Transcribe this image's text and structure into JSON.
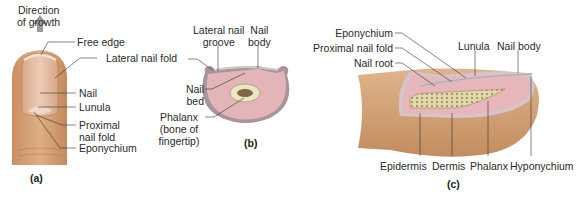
{
  "panels": {
    "a": {
      "caption": "(a)",
      "labels": {
        "direction_line1": "Direction",
        "direction_line2": "of growth",
        "free_edge": "Free edge",
        "lateral_nail_fold": "Lateral nail fold",
        "nail": "Nail",
        "lunula": "Lunula",
        "proximal_line1": "Proximal",
        "proximal_line2": "nail fold",
        "eponychium": "Eponychium"
      }
    },
    "b": {
      "caption": "(b)",
      "labels": {
        "lateral_groove_line1": "Lateral nail",
        "lateral_groove_line2": "groove",
        "nail_body_line1": "Nail",
        "nail_body_line2": "body",
        "nail_bed_line1": "Nail",
        "nail_bed_line2": "bed",
        "phalanx_line1": "Phalanx",
        "phalanx_line2": "(bone of",
        "phalanx_line3": "fingertip)"
      }
    },
    "c": {
      "caption": "(c)",
      "labels": {
        "eponychium": "Eponychium",
        "proximal_nail_fold": "Proximal nail fold",
        "nail_root": "Nail root",
        "lunula": "Lunula",
        "nail_body": "Nail body",
        "epidermis": "Epidermis",
        "dermis": "Dermis",
        "phalanx": "Phalanx",
        "hyponychium": "Hyponychium"
      }
    }
  },
  "colors": {
    "skin": "#d9a57a",
    "skin_dark": "#c08a5e",
    "nail": "#e8c2a8",
    "dermis": "#e8b9bd",
    "epidermis_line": "#9a8e9a",
    "bone": "#e6dfb8",
    "leader": "#333333"
  }
}
